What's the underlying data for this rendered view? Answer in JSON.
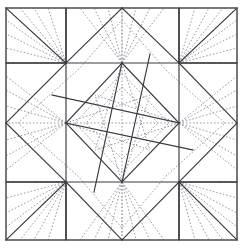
{
  "figure": {
    "type": "crease-pattern",
    "width": 243,
    "height": 248,
    "background_color": "#ffffff"
  },
  "colors": {
    "mountain_fold": "#3a3a42",
    "valley_fold": "#9a9aa2",
    "border": "#55555c",
    "paper": "#ffffff"
  },
  "geometry": {
    "paper_square": {
      "left": 6,
      "top": 8,
      "right": 237,
      "bottom": 240
    },
    "grid_x": [
      6,
      66,
      122,
      179,
      237
    ],
    "grid_y": [
      8,
      63,
      123,
      182,
      240
    ],
    "center": {
      "x": 122,
      "y": 123
    },
    "hubs": [
      {
        "name": "hub-top",
        "x": 122,
        "y": 63
      },
      {
        "name": "hub-left",
        "x": 66,
        "y": 123
      },
      {
        "name": "hub-right",
        "x": 179,
        "y": 123
      },
      {
        "name": "hub-bottom",
        "x": 122,
        "y": 182
      }
    ],
    "edge_points": [
      {
        "name": "top-mid",
        "x": 122,
        "y": 8
      },
      {
        "name": "bottom-mid",
        "x": 122,
        "y": 240
      },
      {
        "name": "left-mid",
        "x": 6,
        "y": 123
      },
      {
        "name": "right-mid",
        "x": 237,
        "y": 123
      }
    ],
    "corner_squares": [
      {
        "name": "top-left",
        "left": 6,
        "top": 8,
        "right": 66,
        "bottom": 63,
        "fan_origin": {
          "x": 66,
          "y": 63
        }
      },
      {
        "name": "top-right",
        "left": 179,
        "top": 8,
        "right": 237,
        "bottom": 63,
        "fan_origin": {
          "x": 179,
          "y": 63
        }
      },
      {
        "name": "bottom-left",
        "left": 6,
        "top": 182,
        "right": 66,
        "bottom": 240,
        "fan_origin": {
          "x": 66,
          "y": 182
        }
      },
      {
        "name": "bottom-right",
        "left": 179,
        "top": 182,
        "right": 237,
        "bottom": 240,
        "fan_origin": {
          "x": 179,
          "y": 182
        }
      }
    ],
    "inner_diamond": [
      {
        "x": 122,
        "y": 63
      },
      {
        "x": 179,
        "y": 123
      },
      {
        "x": 122,
        "y": 182
      },
      {
        "x": 66,
        "y": 123
      }
    ],
    "star_points": [
      {
        "x": 122,
        "y": 8
      },
      {
        "x": 179,
        "y": 63
      },
      {
        "x": 237,
        "y": 123
      },
      {
        "x": 179,
        "y": 182
      },
      {
        "x": 122,
        "y": 240
      },
      {
        "x": 66,
        "y": 182
      },
      {
        "x": 6,
        "y": 123
      },
      {
        "x": 66,
        "y": 63
      }
    ]
  },
  "legend": {
    "mountain_label": "mountain fold (solid)",
    "valley_label": "valley fold (dotted)"
  }
}
